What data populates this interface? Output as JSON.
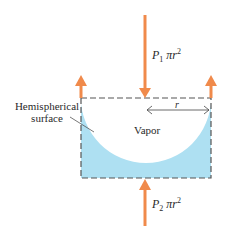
{
  "diagram": {
    "top_force": {
      "P": "P",
      "sub": "1",
      "term": "πr",
      "exp": "2"
    },
    "bottom_force": {
      "P": "P",
      "sub": "2",
      "term": "πr",
      "exp": "2"
    },
    "radius_label": "r",
    "vapor_label": "Vapor",
    "surface_label_line1": "Hemispherical",
    "surface_label_line2": "surface"
  },
  "colors": {
    "arrow": "#f08a4b",
    "liquid": "#aee0f2",
    "box_border": "#555555"
  }
}
